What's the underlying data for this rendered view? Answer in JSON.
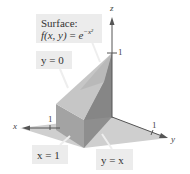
{
  "figure": {
    "surface_label": {
      "title": "Surface:",
      "equation_lhs": "f(x, y)",
      "equation_eq": " = ",
      "equation_base": "e",
      "equation_exp": "−x²"
    },
    "plane_labels": {
      "y_zero": "y = 0",
      "x_one": "x = 1",
      "y_eq_x": "y = x"
    },
    "axes": {
      "x": "x",
      "y": "y",
      "z": "z"
    },
    "ticks": {
      "x_tick": "1",
      "y_tick": "1",
      "z_tick": "1"
    },
    "colors": {
      "base_plane": "#c9c9c9",
      "solid_front": "#9a9a9a",
      "solid_side": "#8a8a8a",
      "surface_light": "#c4c4c4",
      "surface_dark": "#7e7e7e",
      "label_bg": "#ececec",
      "axis": "#555555"
    }
  }
}
